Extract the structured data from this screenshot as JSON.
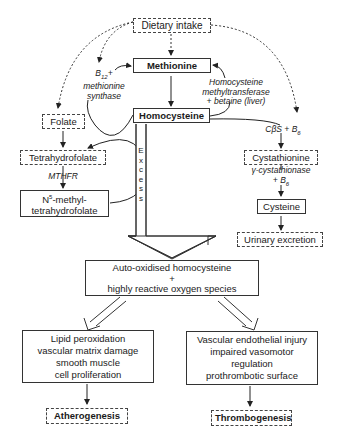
{
  "nodes": {
    "dietary_intake": "Dietary intake",
    "methionine": "Methionine",
    "homocysteine": "Homocysteine",
    "folate": "Folate",
    "tetrahydrofolate": "Tetrahydrofolate",
    "n5_methyl_line1": "-methyl-",
    "n5_methyl_prefix": "N",
    "n5_methyl_sup": "5",
    "n5_methyl_line2": "tetrahydrofolate",
    "cystathionine": "Cystathionine",
    "cysteine": "Cysteine",
    "urinary_excretion": "Urinary excretion",
    "auto_oxidised_line1": "Auto-oxidised homocysteine",
    "auto_oxidised_line2": "+",
    "auto_oxidised_line3": "highly reactive oxygen species",
    "left_effects": [
      "Lipid peroxidation",
      "vascular matrix damage",
      "smooth muscle",
      "cell proliferation"
    ],
    "right_effects": [
      "Vascular endothelial injury",
      "impaired vasomotor",
      "regulation",
      "prothrombotic surface"
    ],
    "atherogenesis": "Atherogenesis",
    "thrombogenesis": "Thrombogenesis"
  },
  "labels": {
    "b12_prefix": "B",
    "b12_sub": "12",
    "b12_suffix": "+",
    "methionine_synthase_1": "methionine",
    "methionine_synthase_2": "synthase",
    "hmt_1": "Homocysteine",
    "hmt_2": "methyltransferase",
    "hmt_3": "+ betaine (liver)",
    "mthfr": "MTHFR",
    "cbs": "CβS + B",
    "cbs_sub": "6",
    "gamma_1": "γ-cystathionase",
    "gamma_2": "+ B",
    "gamma_sub": "6",
    "excess": [
      "E",
      "x",
      "c",
      "e",
      "s",
      "s"
    ]
  }
}
